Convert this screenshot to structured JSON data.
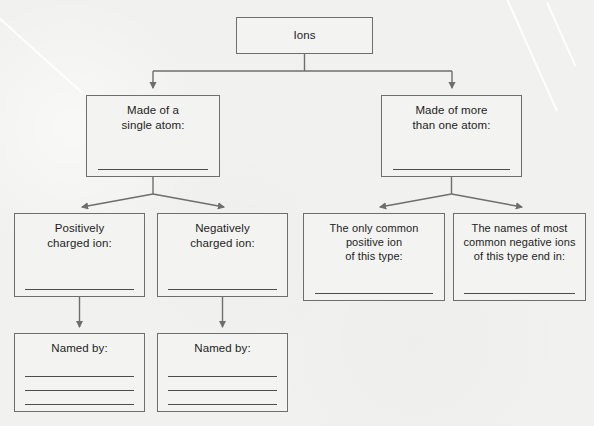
{
  "document": {
    "title": "Ions Concept Map Worksheet",
    "background_color": "#f1f1ef",
    "line_color": "#6e6e6e",
    "text_color": "#1d1d1d"
  },
  "nodes": {
    "ions": {
      "label": "Ions",
      "blank_lines": 0
    },
    "single_atom": {
      "label": "Made of a\nsingle atom:",
      "blank_lines": 1
    },
    "multi_atom": {
      "label": "Made of more\nthan one atom:",
      "blank_lines": 1
    },
    "positive_ion": {
      "label": "Positively\ncharged ion:",
      "blank_lines": 1
    },
    "negative_ion": {
      "label": "Negatively\ncharged ion:",
      "blank_lines": 1
    },
    "only_common_positive": {
      "label": "The only common\npositive ion\nof this type:",
      "blank_lines": 1
    },
    "negative_names": {
      "label": "The names of most\ncommon negative ions\nof this type end in:",
      "blank_lines": 1
    },
    "named_by_positive": {
      "label": "Named by:",
      "blank_lines": 3
    },
    "named_by_negative": {
      "label": "Named by:",
      "blank_lines": 3
    }
  },
  "connectors": [
    {
      "from": "ions",
      "to": "single_atom",
      "style": "elbow-arrow"
    },
    {
      "from": "ions",
      "to": "multi_atom",
      "style": "elbow-arrow"
    },
    {
      "from": "single_atom",
      "to": "positive_ion",
      "style": "diagonal-arrow"
    },
    {
      "from": "single_atom",
      "to": "negative_ion",
      "style": "diagonal-arrow"
    },
    {
      "from": "multi_atom",
      "to": "only_common_positive",
      "style": "diagonal-arrow"
    },
    {
      "from": "multi_atom",
      "to": "negative_names",
      "style": "diagonal-arrow"
    },
    {
      "from": "positive_ion",
      "to": "named_by_positive",
      "style": "straight-arrow"
    },
    {
      "from": "negative_ion",
      "to": "named_by_negative",
      "style": "straight-arrow"
    }
  ]
}
